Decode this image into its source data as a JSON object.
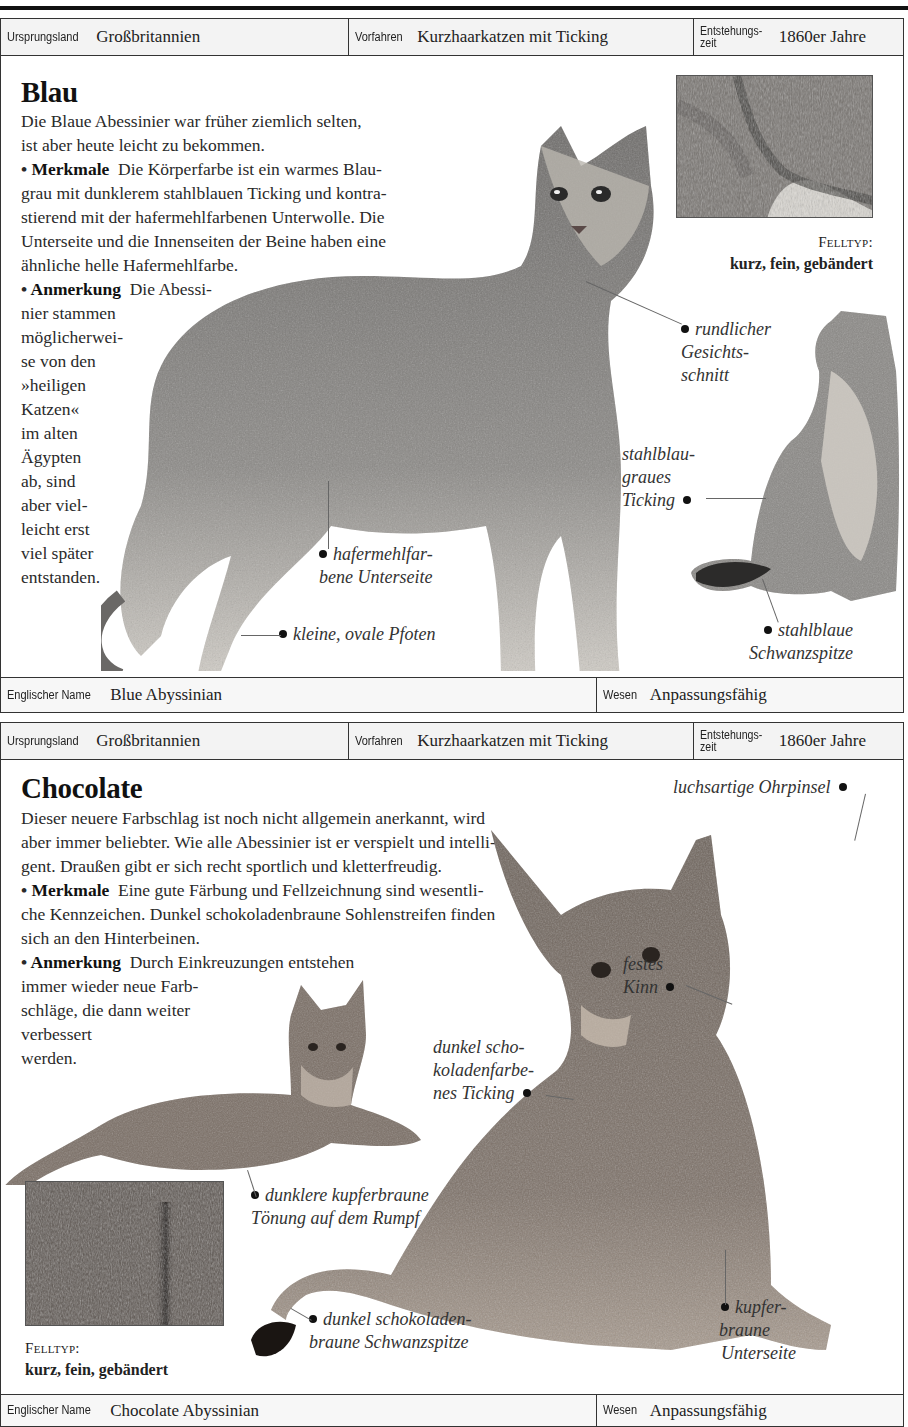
{
  "sections": [
    {
      "info": {
        "origin_label": "Ursprungsland",
        "origin_value": "Großbritannien",
        "ancestors_label": "Vorfahren",
        "ancestors_value": "Kurzhaarkatzen mit Ticking",
        "time_label_1": "Entstehungs-",
        "time_label_2": "zeit",
        "time_value": "1860er Jahre"
      },
      "title": "Blau",
      "intro": "Die Blaue Abessinier war früher ziemlich selten, ist aber heute leicht zu bekommen.",
      "features_label": "Merkmale",
      "features_text": "Die Körperfarbe ist ein warmes Blaugrau mit dunklerem stahlblauen Ticking und kontrastierend mit der hafermehlfarbenen Unterwolle. Die Unterseite und die Innenseiten der Beine haben eine ähnliche helle Hafermehlfarbe.",
      "note_label": "Anmerkung",
      "note_text": "Die Abessinier stammen möglicherweise von den »heiligen Katzen« im alten Ägypten ab, sind aber vielleicht erst viel später entstanden.",
      "coat": {
        "label": "Felltyp:",
        "value": "kurz, fein, gebändert"
      },
      "annotations": [
        "rundlicher Gesichtsschnitt",
        "stahlblaugraues Ticking",
        "hafermehlfarbene Unterseite",
        "kleine, ovale Pfoten",
        "stahlblaue Schwanzspitze"
      ],
      "footer": {
        "english_label": "Englischer Name",
        "english_value": "Blue Abyssinian",
        "nature_label": "Wesen",
        "nature_value": "Anpassungsfähig"
      }
    },
    {
      "info": {
        "origin_label": "Ursprungsland",
        "origin_value": "Großbritannien",
        "ancestors_label": "Vorfahren",
        "ancestors_value": "Kurzhaarkatzen mit Ticking",
        "time_label_1": "Entstehungs-",
        "time_label_2": "zeit",
        "time_value": "1860er Jahre"
      },
      "title": "Chocolate",
      "intro": "Dieser neuere Farbschlag ist noch nicht allgemein anerkannt, wird aber immer beliebter. Wie alle Abessinier ist er verspielt und intelligent. Draußen gibt er sich recht sportlich und kletterfreudig.",
      "features_label": "Merkmale",
      "features_text": "Eine gute Färbung und Fellzeichnung sind wesentliche Kennzeichen. Dunkel schokoladenbraune Sohlenstreifen finden sich an den Hinterbeinen.",
      "note_label": "Anmerkung",
      "note_text": "Durch Einkreuzungen entstehen immer wieder neue Farbschläge, die dann weiter verbessert werden.",
      "coat": {
        "label": "Felltyp:",
        "value": "kurz, fein, gebändert"
      },
      "annotations": [
        "luchsartige Ohrpinsel",
        "festes Kinn",
        "dunkel schokoladenfarbenes Ticking",
        "dunklere kupferbraune Tönung auf dem Rumpf",
        "dunkel schokoladenbraune Schwanzspitze",
        "kupferbraune Unterseite"
      ],
      "footer": {
        "english_label": "Englischer Name",
        "english_value": "Chocolate Abyssinian",
        "nature_label": "Wesen",
        "nature_value": "Anpassungsfähig"
      }
    }
  ],
  "display": {
    "blau_features_l1": "Die Körperfarbe ist ein warmes Blau-",
    "blau_features_l2": "grau mit dunklerem stahlblauen Ticking und kontra-",
    "blau_features_l3": "stierend mit der hafermehlfarbenen Unterwolle. Die",
    "blau_features_l4": "Unterseite und die Innenseiten der Beine haben eine",
    "blau_features_l5": "ähnliche helle Hafermehlfarbe.",
    "blau_intro_l1": "Die Blaue Abessinier war früher ziemlich selten,",
    "blau_intro_l2": "ist aber heute leicht zu bekommen.",
    "blau_note_l1": "Die Abessi-",
    "blau_note_lines": [
      "nier stammen",
      "möglicherwei-",
      "se von den",
      "»heiligen",
      "Katzen«",
      "im alten",
      "Ägypten",
      "ab, sind",
      "aber viel-",
      "leicht erst",
      "viel später",
      "entstanden."
    ],
    "blau_ann": {
      "face_1": "rundlicher",
      "face_2": "Gesichts-",
      "face_3": "schnitt",
      "tick_1": "stahlblau-",
      "tick_2": "graues",
      "tick_3": "Ticking",
      "under_1": "hafermehlfar-",
      "under_2": "bene Unterseite",
      "paws": "kleine, ovale Pfoten",
      "tail_1": "stahlblaue",
      "tail_2": "Schwanzspitze"
    },
    "choc_intro_l1": "Dieser neuere Farbschlag ist  noch nicht allgemein anerkannt, wird",
    "choc_intro_l2": "aber immer beliebter. Wie alle Abessinier ist er verspielt und intelli-",
    "choc_intro_l3": "gent. Draußen gibt er sich recht sportlich und kletterfreudig.",
    "choc_features_l1": "Eine gute Färbung und Fellzeichnung sind wesentli-",
    "choc_features_l2": "che Kennzeichen. Dunkel schokoladenbraune Sohlenstreifen finden",
    "choc_features_l3": "sich an den Hinterbeinen.",
    "choc_note_l1": "Durch Einkreuzungen entstehen",
    "choc_note_lines": [
      "immer wieder neue Farb-",
      "schläge, die dann weiter",
      "verbessert",
      "werden."
    ],
    "choc_ann": {
      "ear": "luchsartige Ohrpinsel",
      "chin_1": "festes",
      "chin_2": "Kinn",
      "tick_1": "dunkel scho-",
      "tick_2": "koladenfarbe-",
      "tick_3": "nes Ticking",
      "body_1": "dunklere kupferbraune",
      "body_2": "Tönung auf dem Rumpf",
      "tail_1": "dunkel schokoladen-",
      "tail_2": "braune Schwanzspitze",
      "under_1": "kupfer-",
      "under_2": "braune",
      "under_3": "Unterseite"
    }
  },
  "colors": {
    "rule": "#111111",
    "bar_bg": "#f3f3f3",
    "blue_cat_fur": "#8d8c8a",
    "choc_cat_fur": "#7a6f66"
  }
}
